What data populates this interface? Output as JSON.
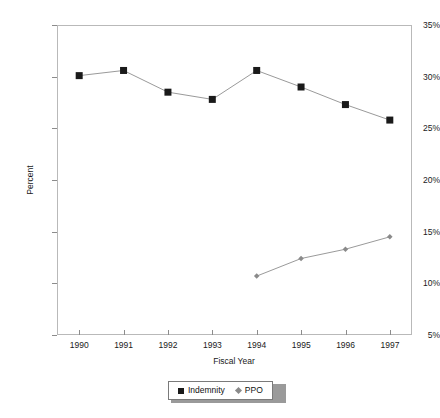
{
  "chart_data": {
    "type": "line",
    "title": "",
    "xlabel": "Fiscal Year",
    "ylabel": "Percent",
    "categories": [
      "1990",
      "1991",
      "1992",
      "1993",
      "1994",
      "1995",
      "1996",
      "1997"
    ],
    "x": [
      1990,
      1991,
      1992,
      1993,
      1994,
      1995,
      1996,
      1997
    ],
    "xlim": [
      1989.5,
      1997.5
    ],
    "ylim": [
      5,
      35
    ],
    "ytick_labels": [
      "5%",
      "10%",
      "15%",
      "20%",
      "25%",
      "30%",
      "35%"
    ],
    "ytick_values": [
      5,
      10,
      15,
      20,
      25,
      30,
      35
    ],
    "grid": false,
    "legend_position": "bottom-center",
    "series": [
      {
        "name": "Indemnity",
        "marker": "square",
        "color": "#1a1a1a",
        "values": [
          30.1,
          30.6,
          28.5,
          27.8,
          30.6,
          29.0,
          27.3,
          25.8
        ]
      },
      {
        "name": "PPO",
        "marker": "diamond",
        "color": "#8a8a8a",
        "values": [
          null,
          null,
          null,
          null,
          10.7,
          12.4,
          13.3,
          14.5
        ]
      }
    ]
  },
  "legend": {
    "entries": [
      {
        "label": "Indemnity"
      },
      {
        "label": "PPO"
      }
    ]
  }
}
